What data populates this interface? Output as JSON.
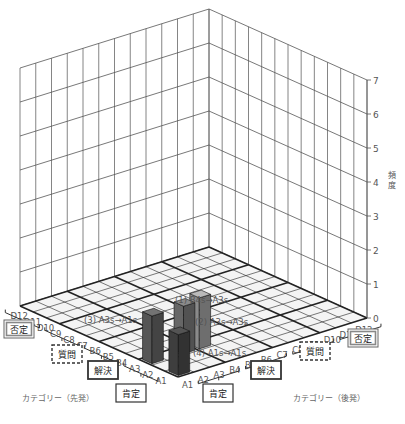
{
  "chart_data": {
    "type": "bar3d",
    "title": "",
    "zlabel": "頻度",
    "zlim": [
      0,
      7
    ],
    "zticks": [
      "0",
      "1",
      "2",
      "3",
      "4",
      "5",
      "6",
      "7"
    ],
    "x_axis": {
      "label": "カテゴリー（先発）",
      "categories": [
        "A1",
        "A2",
        "A3",
        "B4",
        "B5",
        "B6",
        "C7",
        "C8",
        "C9",
        "D10",
        "D11",
        "D12"
      ],
      "groups": [
        {
          "label": "肯定",
          "range": [
            "A1",
            "A3"
          ],
          "style": "solid"
        },
        {
          "label": "解決",
          "range": [
            "B4",
            "B6"
          ],
          "style": "solid-thick"
        },
        {
          "label": "質問",
          "range": [
            "C7",
            "C9"
          ],
          "style": "dashed"
        },
        {
          "label": "否定",
          "range": [
            "D10",
            "D12"
          ],
          "style": "double"
        }
      ]
    },
    "y_axis": {
      "label": "カテゴリー（後発）",
      "categories": [
        "A1",
        "A2",
        "A3",
        "B4",
        "B5",
        "B6",
        "C7",
        "C8",
        "C9",
        "D10",
        "D11",
        "D12"
      ],
      "groups": [
        {
          "label": "肯定",
          "range": [
            "A1",
            "A3"
          ],
          "style": "solid"
        },
        {
          "label": "解決",
          "range": [
            "B4",
            "B6"
          ],
          "style": "solid-thick"
        },
        {
          "label": "質問",
          "range": [
            "C7",
            "C9"
          ],
          "style": "dashed"
        },
        {
          "label": "否定",
          "range": [
            "D10",
            "D12"
          ],
          "style": "double"
        }
      ]
    },
    "bars": [
      {
        "label": "(1) B4s→A3s",
        "lead": "A3",
        "trail": "B4",
        "value": 1.5,
        "color": "#8a8a8a"
      },
      {
        "label": "(2) A3s→A3s",
        "lead": "A3",
        "trail": "A3",
        "value": 1.4,
        "color": "#666666"
      },
      {
        "label": "(3) A3s→A1s",
        "lead": "A3",
        "trail": "A1",
        "value": 1.4,
        "color": "#555555"
      },
      {
        "label": "(4) A1s→A1s",
        "lead": "A1",
        "trail": "A1",
        "value": 1.2,
        "color": "#3e3e3e"
      }
    ],
    "grid": true
  },
  "labels": {
    "zlabel_line1": "頻",
    "zlabel_line2": "度",
    "x_axis_label": "カテゴリー（先発）",
    "y_axis_label": "カテゴリー（後発）",
    "annotation_1": "(1) B4s→A3s",
    "annotation_2": "(2) A3s→A3s",
    "annotation_3": "(3) A3s→A1s",
    "annotation_4": "(4) A1s→A1s"
  }
}
